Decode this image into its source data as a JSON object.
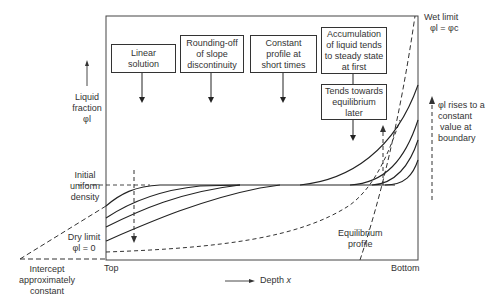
{
  "y_axis": {
    "label": [
      "Liquid",
      "fraction",
      "φl"
    ]
  },
  "x_axis": {
    "label": "Depth",
    "variable": "x",
    "left_end": "Top",
    "right_end": "Bottom"
  },
  "left_labels": {
    "initial": [
      "Initial",
      "uniform",
      "density"
    ],
    "dry_limit": [
      "Dry limit",
      "φl = 0"
    ],
    "intercept": [
      "Intercept",
      "approximately",
      "constant"
    ]
  },
  "right_labels": {
    "wet_limit": [
      "Wet limit",
      "φl = φc"
    ],
    "rises": [
      "φl rises to a",
      "constant",
      "value at",
      "boundary"
    ]
  },
  "boxes": [
    {
      "lines": [
        "Linear",
        "solution"
      ]
    },
    {
      "lines": [
        "Rounding-off",
        "of slope",
        "discontinuity"
      ]
    },
    {
      "lines": [
        "Constant",
        "profile at",
        "short times"
      ]
    },
    {
      "lines": [
        "Accumulation",
        "of liquid tends",
        "to steady state",
        "at first"
      ]
    },
    {
      "lines": [
        "Tends towards",
        "equilibrium",
        "later"
      ]
    }
  ],
  "equilibrium_label": [
    "Equilibrium",
    "profile"
  ]
}
